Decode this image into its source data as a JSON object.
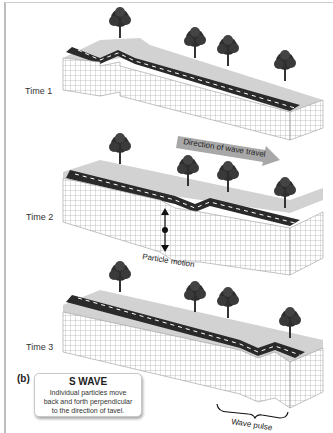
{
  "figure": {
    "panel_label": "(b)",
    "time_labels": [
      "Time 1",
      "Time 2",
      "Time 3"
    ],
    "arrow_label": "Direction of wave travel",
    "particle_motion_label": "Particle motion",
    "wave_pulse_label": "Wave pulse",
    "callout": {
      "title": "S WAVE",
      "lines": [
        "Individual particles move",
        "back and forth perpendicular",
        "to the direction of tavel."
      ]
    },
    "colors": {
      "road": "#2a2a2a",
      "grass": "#cfcfcf",
      "grid_line": "#9a9a9a",
      "arrow_fill": "#a8a8a8",
      "tree": "#2e2e2e"
    }
  }
}
